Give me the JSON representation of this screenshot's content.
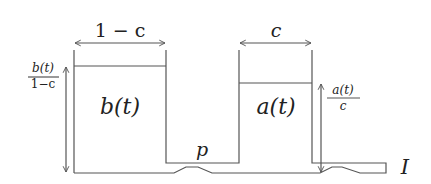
{
  "diagram": {
    "labels": {
      "left_width": "1 − c",
      "right_width": "c",
      "left_area": "b(t)",
      "right_area": "a(t)",
      "left_height_num": "b(t)",
      "left_height_den": "1−c",
      "right_height_num": "a(t)",
      "right_height_den": "c",
      "middle": "p",
      "interval": "I"
    },
    "colors": {
      "stroke": "#555555",
      "text": "#222222",
      "background": "#ffffff"
    }
  }
}
